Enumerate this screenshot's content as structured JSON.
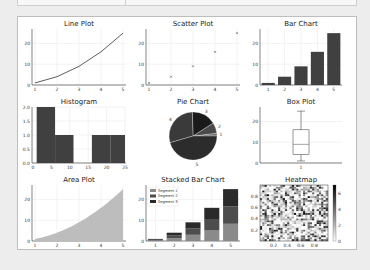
{
  "page": {
    "background": "#ededed"
  },
  "topbar": {
    "segments": 2
  },
  "chart_data": [
    {
      "type": "line",
      "title": "Line Plot",
      "x": [
        1,
        2,
        3,
        4,
        5
      ],
      "y": [
        1,
        4,
        9,
        16,
        25
      ],
      "xticks": [
        "1",
        "2",
        "3",
        "4",
        "5"
      ],
      "yticks": [
        "0",
        "10",
        "20"
      ],
      "ylim": [
        0,
        27
      ],
      "grid": true,
      "color": "#333333"
    },
    {
      "type": "scatter",
      "title": "Scatter Plot",
      "x": [
        1,
        2,
        3,
        4,
        5
      ],
      "y": [
        1,
        4,
        9,
        16,
        25
      ],
      "marker": "x",
      "xticks": [
        "1",
        "2",
        "3",
        "4",
        "5"
      ],
      "yticks": [
        "0",
        "10",
        "20"
      ],
      "ylim": [
        0,
        27
      ],
      "grid": true
    },
    {
      "type": "bar",
      "title": "Bar Chart",
      "categories": [
        "1",
        "2",
        "3",
        "4",
        "5"
      ],
      "values": [
        1,
        4,
        9,
        16,
        25
      ],
      "yticks": [
        "0",
        "10",
        "20"
      ],
      "ylim": [
        0,
        27
      ],
      "grid": true,
      "color": "#404040"
    },
    {
      "type": "bar",
      "title": "Histogram",
      "bins": [
        [
          1,
          6
        ],
        [
          6,
          11
        ],
        [
          11,
          16
        ],
        [
          16,
          21
        ],
        [
          21,
          25
        ]
      ],
      "counts": [
        2,
        1,
        0,
        1,
        1
      ],
      "xticks": [
        "0",
        "5",
        "10",
        "15",
        "20",
        "25"
      ],
      "yticks": [
        "0.0",
        "0.5",
        "1.0",
        "1.5",
        "2.0"
      ],
      "ylim": [
        0,
        2
      ],
      "grid": true
    },
    {
      "type": "pie",
      "title": "Pie Chart",
      "labels": [
        "1",
        "2",
        "3",
        "4",
        "5"
      ],
      "values": [
        1,
        4,
        9,
        16,
        25
      ],
      "colors": [
        "#6b6b6b",
        "#4a4a4a",
        "#1a1a1a",
        "#3a3a3a",
        "#2c2c2c"
      ]
    },
    {
      "type": "box",
      "title": "Box Plot",
      "xticks": [
        "1"
      ],
      "stats": {
        "min": 1,
        "q1": 4,
        "median": 9,
        "q3": 16,
        "max": 25
      },
      "yticks": [
        "0",
        "10",
        "20"
      ],
      "ylim": [
        0,
        27
      ],
      "grid": true
    },
    {
      "type": "area",
      "title": "Area Plot",
      "x": [
        1,
        2,
        3,
        4,
        5
      ],
      "y": [
        1,
        4,
        9,
        16,
        25
      ],
      "xticks": [
        "1",
        "2",
        "3",
        "4",
        "5"
      ],
      "yticks": [
        "0",
        "10",
        "20"
      ],
      "ylim": [
        0,
        27
      ],
      "grid": true,
      "color": "#bdbdbd"
    },
    {
      "type": "bar",
      "stacked": true,
      "title": "Stacked Bar Chart",
      "categories": [
        "1",
        "2",
        "3",
        "4",
        "5"
      ],
      "series": [
        {
          "name": "Segment 1",
          "values": [
            0.3,
            1.3,
            3,
            5.3,
            8.3
          ],
          "color": "#8a8a8a"
        },
        {
          "name": "Segment 2",
          "values": [
            0.3,
            1.3,
            3,
            5.3,
            8.3
          ],
          "color": "#4d4d4d"
        },
        {
          "name": "Segment 3",
          "values": [
            0.4,
            1.4,
            3,
            5.4,
            8.4
          ],
          "color": "#2a2a2a"
        }
      ],
      "yticks": [
        "0",
        "10",
        "20"
      ],
      "ylim": [
        0,
        27
      ],
      "legend_position": "upper left",
      "grid": true
    },
    {
      "type": "heatmap",
      "title": "Heatmap",
      "xticks": [
        "0.2",
        "0.4",
        "0.6",
        "0.8"
      ],
      "yticks": [
        "0.2",
        "0.4",
        "0.6",
        "0.8"
      ],
      "colorbar_ticks": [
        "0",
        "2",
        "4",
        "6"
      ],
      "range": [
        0,
        7
      ],
      "grid_size": [
        30,
        30
      ]
    }
  ]
}
